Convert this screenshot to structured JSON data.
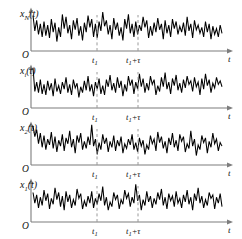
{
  "figure": {
    "background_color": "#ffffff",
    "trace_color": "#000000",
    "axis_color": "#7d7d7d",
    "dash_color": "#9a9a9a",
    "origin_label": "O",
    "time_axis_label": "t",
    "tick_labels": {
      "t1": "t",
      "t1_sub": "1",
      "t2_lead": "t",
      "t2_sub": "1",
      "t2_tail": "+τ"
    },
    "panels": [
      {
        "name": "panel-xN",
        "label_base": "x",
        "label_sub": "N",
        "label_tail": "(t)",
        "baseline_y": 51
      },
      {
        "name": "panel-xi",
        "label_base": "x",
        "label_sub": "i",
        "label_tail": "(t)",
        "baseline_y": 108
      },
      {
        "name": "panel-x2",
        "label_base": "x",
        "label_sub": "2",
        "label_tail": "(t)",
        "baseline_y": 165
      },
      {
        "name": "panel-x1",
        "label_base": "x",
        "label_sub": "1",
        "label_tail": "(t)",
        "baseline_y": 222
      }
    ]
  },
  "chart_data": {
    "type": "line",
    "title": "",
    "xlabel": "t",
    "ylabel": "",
    "grid": false,
    "legend": false,
    "axis_x_start": 31,
    "axis_x_end": 232,
    "marker_lines": [
      {
        "label": "t1",
        "x": 97
      },
      {
        "label": "t1+tau",
        "x": 138
      }
    ],
    "series": [
      {
        "name": "x_N(t)",
        "values": [
          30,
          17,
          26,
          14,
          23,
          12,
          25,
          13,
          22,
          11,
          27,
          16,
          24,
          8,
          20,
          12,
          31,
          19,
          29,
          15,
          22,
          10,
          26,
          18,
          28,
          13,
          21,
          9,
          24,
          16,
          30,
          20,
          27,
          12,
          23,
          11,
          25,
          17,
          33,
          21,
          26,
          14,
          22,
          10,
          28,
          18,
          24,
          13,
          20,
          9,
          27,
          19,
          31,
          15,
          23,
          12,
          25,
          14,
          22,
          17,
          29,
          20,
          26,
          11,
          21,
          13,
          24,
          16,
          28,
          18,
          23,
          10,
          26,
          15,
          22,
          12,
          27,
          19,
          25,
          14,
          21,
          16,
          24,
          13,
          29,
          17,
          23,
          11,
          26,
          18,
          22,
          15,
          20,
          12,
          25,
          16,
          23,
          10,
          21,
          14,
          19,
          12,
          22,
          15
        ]
      },
      {
        "name": "x_i(t)",
        "values": [
          34,
          14,
          22,
          13,
          24,
          12,
          20,
          11,
          23,
          15,
          21,
          10,
          25,
          14,
          19,
          12,
          22,
          16,
          26,
          13,
          20,
          11,
          24,
          17,
          21,
          9,
          18,
          13,
          23,
          15,
          27,
          14,
          20,
          10,
          22,
          16,
          25,
          12,
          19,
          11,
          24,
          18,
          28,
          15,
          21,
          13,
          26,
          17,
          23,
          10,
          20,
          14,
          27,
          19,
          24,
          12,
          22,
          16,
          29,
          18,
          25,
          13,
          21,
          15,
          27,
          20,
          24,
          11,
          19,
          14,
          26,
          18,
          30,
          16,
          22,
          12,
          25,
          19,
          28,
          15,
          21,
          13,
          24,
          17,
          27,
          20,
          23,
          14,
          26,
          18,
          22,
          11,
          25,
          16,
          29,
          19,
          24,
          13,
          21,
          17,
          26,
          20,
          23,
          18
        ]
      },
      {
        "name": "x_2(t)",
        "values": [
          33,
          24,
          30,
          18,
          27,
          15,
          25,
          13,
          22,
          17,
          28,
          14,
          24,
          11,
          21,
          16,
          26,
          12,
          23,
          18,
          29,
          15,
          22,
          10,
          25,
          19,
          27,
          13,
          20,
          14,
          24,
          17,
          34,
          16,
          22,
          9,
          19,
          13,
          26,
          18,
          23,
          11,
          20,
          15,
          25,
          12,
          21,
          16,
          24,
          10,
          18,
          14,
          22,
          17,
          26,
          13,
          19,
          11,
          23,
          16,
          21,
          9,
          17,
          13,
          25,
          18,
          22,
          12,
          28,
          19,
          24,
          14,
          20,
          10,
          23,
          17,
          27,
          15,
          21,
          12,
          26,
          20,
          24,
          11,
          18,
          14,
          29,
          16,
          22,
          8,
          17,
          13,
          25,
          19,
          23,
          10,
          20,
          15,
          27,
          18,
          22,
          12,
          19,
          16
        ]
      },
      {
        "name": "x_1(t)",
        "values": [
          25,
          16,
          23,
          12,
          21,
          14,
          27,
          18,
          24,
          11,
          20,
          15,
          29,
          19,
          25,
          13,
          22,
          10,
          26,
          17,
          23,
          12,
          19,
          14,
          28,
          20,
          24,
          11,
          18,
          13,
          22,
          16,
          26,
          12,
          20,
          15,
          24,
          18,
          30,
          14,
          21,
          10,
          17,
          13,
          25,
          19,
          23,
          11,
          19,
          15,
          27,
          20,
          24,
          13,
          21,
          16,
          32,
          18,
          23,
          10,
          19,
          14,
          26,
          17,
          22,
          12,
          20,
          15,
          25,
          19,
          28,
          14,
          21,
          11,
          24,
          18,
          22,
          13,
          26,
          16,
          20,
          12,
          23,
          17,
          27,
          15,
          21,
          10,
          24,
          18,
          29,
          16,
          22,
          12,
          19,
          14,
          25,
          20,
          23,
          11,
          21,
          16,
          24,
          13
        ]
      }
    ]
  }
}
